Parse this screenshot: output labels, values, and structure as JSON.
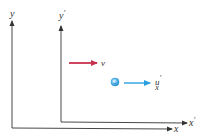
{
  "diagram": {
    "type": "reference-frames",
    "frames": {
      "unprimed": {
        "x_label": "x",
        "y_label": "y",
        "axis_color": "#333333"
      },
      "primed": {
        "x_label": "x",
        "x_prime": "′",
        "y_label": "y",
        "y_prime": "′",
        "axis_color": "#333333"
      }
    },
    "frame_velocity": {
      "label": "v",
      "color": "#c8324f"
    },
    "particle": {
      "color": "#2a9fe0",
      "velocity": {
        "label": "u",
        "prime": "′",
        "subscript": "x",
        "color": "#2a9fe0"
      }
    }
  }
}
